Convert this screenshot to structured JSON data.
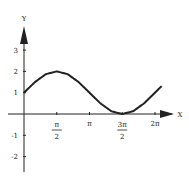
{
  "chart_data": {
    "type": "line",
    "title": "",
    "xlabel": "X",
    "ylabel": "Y",
    "xlim": [
      0,
      6.6
    ],
    "ylim": [
      -2.6,
      4
    ],
    "grid": false,
    "legend": null,
    "x_ticks": [
      {
        "value": 1.5708,
        "label_num": "π",
        "label_den": "2",
        "fraction": true
      },
      {
        "value": 3.1416,
        "label": "π",
        "fraction": false
      },
      {
        "value": 4.7124,
        "label_num": "3π",
        "label_den": "2",
        "fraction": true
      },
      {
        "value": 6.2832,
        "label": "2π",
        "fraction": false
      }
    ],
    "y_ticks": [
      {
        "value": 3,
        "label": "3"
      },
      {
        "value": 2,
        "label": "2"
      },
      {
        "value": 1,
        "label": "1"
      },
      {
        "value": -1,
        "label": "-1"
      },
      {
        "value": -2,
        "label": "-2"
      }
    ],
    "series": [
      {
        "name": "curve",
        "x": [
          0,
          0.5236,
          1.0472,
          1.5708,
          2.0944,
          2.618,
          3.1416,
          3.6652,
          4.1888,
          4.7124,
          5.236,
          5.7596,
          6.2832,
          6.6
        ],
        "values": [
          1,
          1.5,
          1.87,
          2,
          1.87,
          1.5,
          1,
          0.5,
          0.13,
          0,
          0.13,
          0.5,
          1,
          1.31
        ]
      }
    ]
  }
}
